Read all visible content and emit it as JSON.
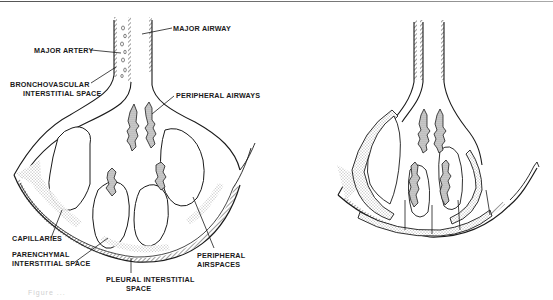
{
  "figure": {
    "left_panel": {
      "description": "Normal lung unit",
      "labels": {
        "major_artery": "MAJOR ARTERY",
        "major_airway": "MAJOR AIRWAY",
        "bronchovascular_line1": "BRONCHOVASCULAR",
        "bronchovascular_line2": "INTERSTITIAL SPACE",
        "peripheral_airways": "PERIPHERAL AIRWAYS",
        "capillaries": "CAPILLARIES",
        "parenchymal_line1": "PARENCHYMAL",
        "parenchymal_line2": "INTERSTITIAL SPACE",
        "pleural_line1": "PLEURAL INTERSTITIAL",
        "pleural_line2": "SPACE",
        "peripheral_airspaces_line1": "PERIPHERAL",
        "peripheral_airspaces_line2": "AIRSPACES"
      }
    },
    "right_panel": {
      "description": "Lung unit with thickened interstitium"
    },
    "caption_fragment": "Figure ..."
  },
  "colors": {
    "ink": "#1a1a1a",
    "stipple": "#bdbdbd",
    "paper": "#ffffff",
    "rule": "#666666"
  }
}
